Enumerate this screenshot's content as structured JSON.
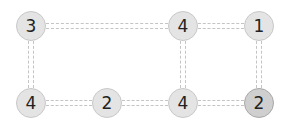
{
  "puzzle": {
    "type": "hashi-bridges",
    "nodes": [
      {
        "id": "r1c1",
        "value": "3",
        "x": 31,
        "y": 26,
        "selected": false
      },
      {
        "id": "r1c3",
        "value": "4",
        "x": 183,
        "y": 26,
        "selected": false
      },
      {
        "id": "r1c4",
        "value": "1",
        "x": 259,
        "y": 26,
        "selected": false
      },
      {
        "id": "r2c1",
        "value": "4",
        "x": 31,
        "y": 103,
        "selected": false
      },
      {
        "id": "r2c2",
        "value": "2",
        "x": 107,
        "y": 103,
        "selected": false
      },
      {
        "id": "r2c3",
        "value": "4",
        "x": 183,
        "y": 103,
        "selected": false
      },
      {
        "id": "r2c4",
        "value": "2",
        "x": 259,
        "y": 103,
        "selected": true
      }
    ],
    "bridges": [
      {
        "from": "r1c1",
        "to": "r1c3",
        "count": 2
      },
      {
        "from": "r1c3",
        "to": "r1c4",
        "count": 2
      },
      {
        "from": "r1c1",
        "to": "r2c1",
        "count": 2
      },
      {
        "from": "r1c3",
        "to": "r2c3",
        "count": 2
      },
      {
        "from": "r1c4",
        "to": "r2c4",
        "count": 2
      },
      {
        "from": "r2c1",
        "to": "r2c2",
        "count": 2
      },
      {
        "from": "r2c2",
        "to": "r2c3",
        "count": 2
      },
      {
        "from": "r2c3",
        "to": "r2c4",
        "count": 2
      }
    ]
  }
}
